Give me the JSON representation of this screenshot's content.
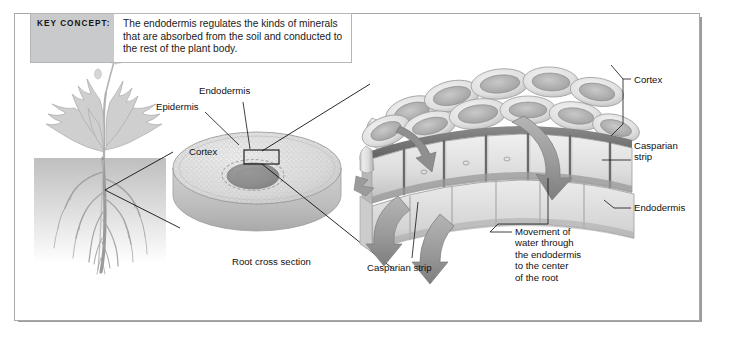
{
  "figure": {
    "key_concept": {
      "tag": "KEY CONCEPT:",
      "text": "The endodermis regulates the kinds of minerals that are absorbed from the soil and conducted to the rest of the plant body."
    },
    "panels": {
      "plant": {
        "name": "whole-plant-illustration"
      },
      "cross_section": {
        "caption": "Root cross section",
        "labels": {
          "epidermis": "Epidermis",
          "endodermis": "Endodermis",
          "cortex": "Cortex"
        }
      },
      "cell_detail": {
        "labels": {
          "cortex": "Cortex",
          "casparian_strip_right": "Casparian\nstrip",
          "endodermis": "Endodermis",
          "casparian_strip_bottom": "Casparian strip",
          "water_movement": "Movement of\nwater through\nthe endodermis\nto the center\nof the root"
        }
      }
    },
    "colors": {
      "frame": "#a6a8aa",
      "tag_background": "#c9cacb",
      "text": "#111111",
      "leader_line": "#111111",
      "cell_fill": "#dcdcdc",
      "casparian_dark": "#6e6e6e",
      "arrow_fill": "#9d9d9d",
      "stele_dark": "#8e8e8e"
    }
  }
}
